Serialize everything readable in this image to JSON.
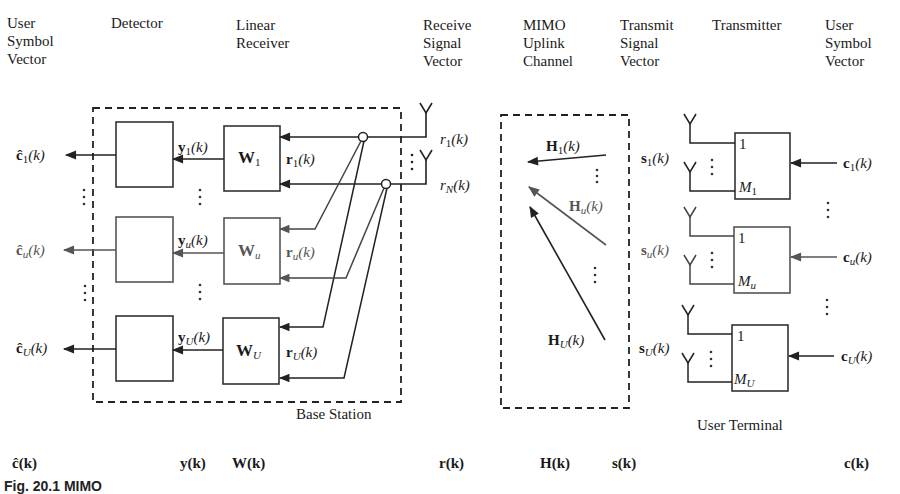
{
  "headers": {
    "user_symbol_vector_left": "User\nSymbol\nVector",
    "detector": "Detector",
    "linear_receiver": "Linear\nReceiver",
    "receive_signal_vector": "Receive\nSignal\nVector",
    "mimo_uplink_channel": "MIMO\nUplink\nChannel",
    "transmit_signal_vector": "Transmit\nSignal\nVector",
    "transmitter": "Transmitter",
    "user_symbol_vector_right": "User\nSymbol\nVector"
  },
  "base_station": {
    "label": "Base Station",
    "detector_outputs": [
      "ĉ",
      "ĉ",
      "ĉ"
    ],
    "detector_output_subscripts": [
      "1",
      "u",
      "U"
    ],
    "filters": [
      "W",
      "W",
      "W"
    ],
    "filter_subscripts": [
      "1",
      "u",
      "U"
    ],
    "filter_outputs": [
      "y",
      "y",
      "y"
    ],
    "filter_inputs": [
      "r",
      "r",
      "r"
    ],
    "receive_antennas": [
      {
        "symbol": "r",
        "subscript": "1"
      },
      {
        "symbol": "r",
        "subscript": "N"
      }
    ],
    "arg": "(k)"
  },
  "channel": {
    "labels": [
      "H",
      "H",
      "H"
    ],
    "subscripts": [
      "1",
      "u",
      "U"
    ],
    "arg": "(k)"
  },
  "user_terminal": {
    "label": "User Terminal",
    "transmit_signals": [
      "s",
      "s",
      "s"
    ],
    "subscripts": [
      "1",
      "u",
      "U"
    ],
    "antenna_port_first": "1",
    "antenna_port_last": [
      "M",
      "M",
      "M"
    ],
    "antenna_port_last_subscripts": [
      "1",
      "u",
      "U"
    ],
    "inputs": [
      "c",
      "c",
      "c"
    ],
    "arg": "(k)"
  },
  "bottom_row": {
    "c_hat": "ĉ(k)",
    "y": "y(k)",
    "W": "W(k)",
    "r": "r(k)",
    "H": "H(k)",
    "s": "s(k)",
    "c": "c(k)"
  },
  "caption": "Fig. 20.1  MIMO"
}
